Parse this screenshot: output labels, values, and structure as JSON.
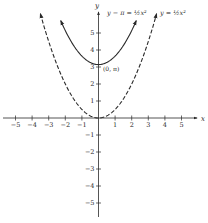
{
  "chart_data": {
    "type": "line",
    "title": "",
    "xlabel": "x",
    "ylabel": "y",
    "xlim": [
      -5.9,
      5.9
    ],
    "ylim": [
      -5.9,
      6.2
    ],
    "grid": false,
    "x_ticks": [
      -5,
      -4,
      -3,
      -2,
      -1,
      1,
      2,
      3,
      4,
      5
    ],
    "x_tick_labels": [
      "−5",
      "−4",
      "−3",
      "−2",
      "−1",
      "1",
      "2",
      "3",
      "4",
      "5"
    ],
    "y_ticks": [
      5,
      4,
      3,
      2,
      1,
      -1,
      -2,
      -3,
      -4,
      -5
    ],
    "y_tick_labels": [
      "5",
      "4",
      "3",
      "2",
      "1",
      "−1",
      "−2",
      "−3",
      "−4",
      "−5"
    ],
    "series": [
      {
        "name": "y − π = ½x²",
        "equation": "y = 0.5*x^2 + pi",
        "style": "solid",
        "x_range": [
          -2.27,
          2.27
        ],
        "vertex": [
          0,
          3.14159
        ],
        "arrows_both_ends": true
      },
      {
        "name": "y = ½x²",
        "equation": "y = 0.5*x^2",
        "style": "dashed",
        "x_range": [
          -3.5,
          3.5
        ],
        "vertex": [
          0,
          0
        ],
        "arrows_both_ends": true
      }
    ],
    "annotations": [
      {
        "text": "(0, π)",
        "x": 0,
        "y": 3.14159
      },
      {
        "text": "y − π = ½x²",
        "anchor": "upper parabola, top label"
      },
      {
        "text": "y = ½x²",
        "anchor": "dashed parabola, top label"
      }
    ]
  },
  "labels": {
    "x_axis": "x",
    "y_axis": "y",
    "upper_eq": "y − π = ½x²",
    "lower_eq": "y = ½x²",
    "vertex_point": "(0, π)"
  }
}
